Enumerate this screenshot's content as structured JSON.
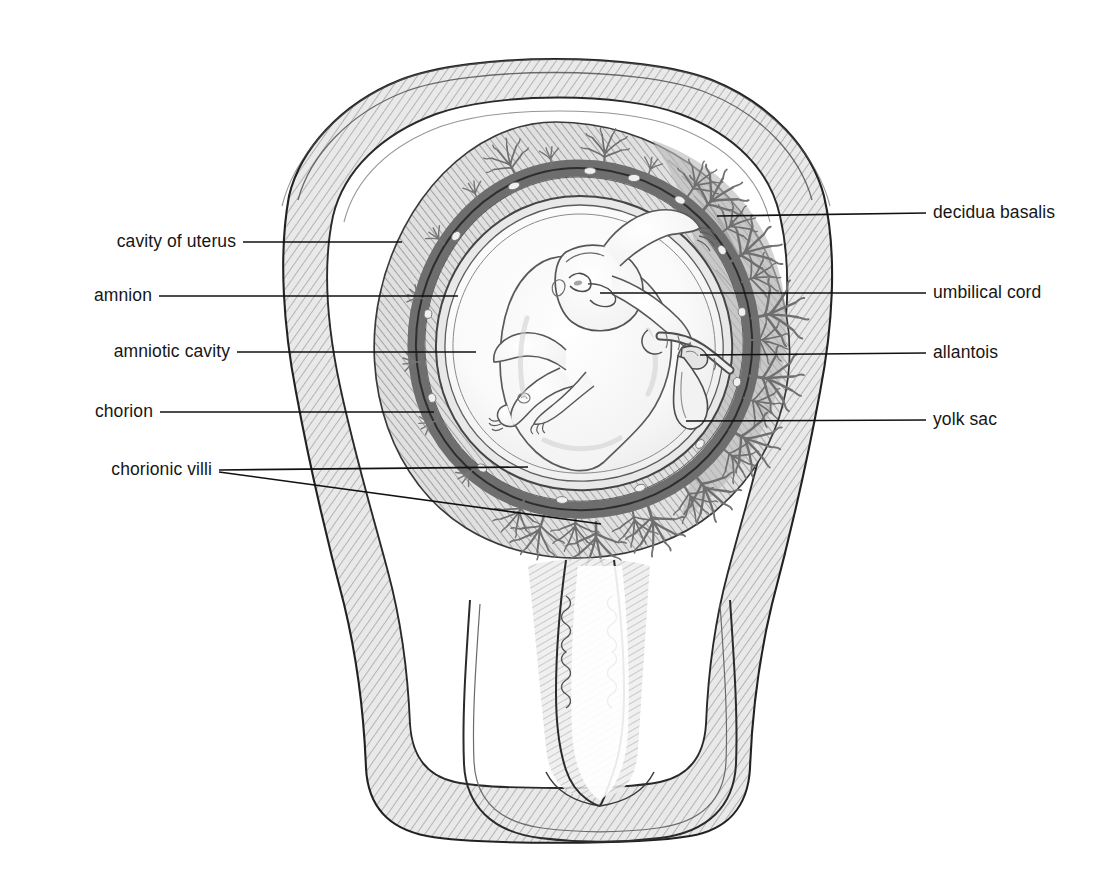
{
  "figure": {
    "style": "pencil-shaded anatomical line drawing, grayscale",
    "background_color": "#ffffff",
    "line_color": "#1a1a1a",
    "leader_line_color": "#111111",
    "shade_tones": {
      "myometrium": "#c9c9c9",
      "decidua": "#b4b4b4",
      "chorion_band": "#9e9e9e",
      "amnion": "#e3e3e3",
      "amniotic_fluid": "#f7f7f7",
      "fetus": "#fbfbfb",
      "villi": "#8c8c8c"
    }
  },
  "labels_left": [
    {
      "id": "cavity-of-uterus",
      "text": "cavity of uterus",
      "text_x": 236,
      "text_y": 242,
      "leaders": [
        {
          "x1": 243,
          "y1": 242,
          "x2": 402,
          "y2": 242
        }
      ]
    },
    {
      "id": "amnion",
      "text": "amnion",
      "text_x": 152,
      "text_y": 296,
      "leaders": [
        {
          "x1": 159,
          "y1": 296,
          "x2": 458,
          "y2": 296
        }
      ]
    },
    {
      "id": "amniotic-cavity",
      "text": "amniotic cavity",
      "text_x": 230,
      "text_y": 352,
      "leaders": [
        {
          "x1": 237,
          "y1": 352,
          "x2": 476,
          "y2": 352
        }
      ]
    },
    {
      "id": "chorion",
      "text": "chorion",
      "text_x": 153,
      "text_y": 412,
      "leaders": [
        {
          "x1": 160,
          "y1": 412,
          "x2": 434,
          "y2": 412
        }
      ]
    },
    {
      "id": "chorionic-villi",
      "text": "chorionic villi",
      "text_x": 212,
      "text_y": 470,
      "leaders": [
        {
          "x1": 219,
          "y1": 470,
          "x2": 528,
          "y2": 467
        },
        {
          "x1": 219,
          "y1": 472,
          "x2": 601,
          "y2": 524
        }
      ]
    }
  ],
  "labels_right": [
    {
      "id": "decidua-basalis",
      "text": "decidua basalis",
      "text_x": 933,
      "text_y": 213,
      "leaders": [
        {
          "x1": 926,
          "y1": 213,
          "x2": 717,
          "y2": 216
        }
      ]
    },
    {
      "id": "umbilical-cord",
      "text": "umbilical cord",
      "text_x": 933,
      "text_y": 293,
      "leaders": [
        {
          "x1": 926,
          "y1": 293,
          "x2": 600,
          "y2": 293
        }
      ]
    },
    {
      "id": "allantois",
      "text": "allantois",
      "text_x": 933,
      "text_y": 353,
      "leaders": [
        {
          "x1": 926,
          "y1": 353,
          "x2": 700,
          "y2": 355
        }
      ]
    },
    {
      "id": "yolk-sac",
      "text": "yolk sac",
      "text_x": 933,
      "text_y": 420,
      "leaders": [
        {
          "x1": 926,
          "y1": 420,
          "x2": 686,
          "y2": 421
        }
      ]
    }
  ],
  "anatomy_parts": [
    {
      "name": "uterine-wall-myometrium",
      "description": "thick pear-shaped uterine wall, pencil cross-hatched"
    },
    {
      "name": "cavity-of-uterus",
      "description": "narrow space between uterine wall and fetal membranes"
    },
    {
      "name": "decidua-basalis",
      "description": "thickened maternal decidua on right where placenta forms"
    },
    {
      "name": "chorion-band",
      "description": "dark grey ring carrying chorionic villi"
    },
    {
      "name": "chorionic-villi",
      "description": "branching tree-like tufts projecting from chorion into decidua"
    },
    {
      "name": "amnion",
      "description": "thin membrane lining the amniotic cavity"
    },
    {
      "name": "amniotic-cavity",
      "description": "pale fluid-filled space surrounding the fetus"
    },
    {
      "name": "fetus",
      "description": "fetus curled in fetal position, head upper-right, limbs flexed"
    },
    {
      "name": "umbilical-cord",
      "description": "cord passing from fetal abdomen to placental plate on the right"
    },
    {
      "name": "allantois",
      "description": "small diverticulum at the base of the umbilical cord"
    },
    {
      "name": "yolk-sac",
      "description": "teardrop-shaped sac hanging below the cord insertion"
    },
    {
      "name": "cervix",
      "description": "lower uterine neck with cervical canal and palmate rugae"
    },
    {
      "name": "cervical-canal",
      "description": "narrow folded canal running down the cervix"
    },
    {
      "name": "vagina",
      "description": "vaginal walls and fornices enclosing the cervix at the bottom"
    }
  ]
}
